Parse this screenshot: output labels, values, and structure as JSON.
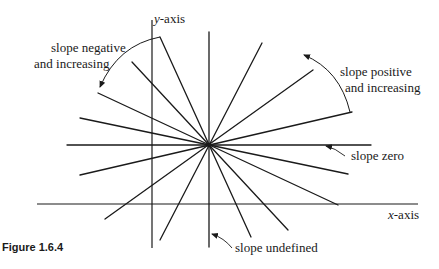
{
  "figure": {
    "caption": "Figure 1.6.4"
  },
  "axes": {
    "y_axis_var": "y",
    "y_axis_suffix": "-axis",
    "x_axis_var": "x",
    "x_axis_suffix": "-axis"
  },
  "annotations": {
    "slope_negative_line1": "slope negative",
    "slope_negative_line2": "and increasing",
    "slope_positive_line1": "slope positive",
    "slope_positive_line2": "and increasing",
    "slope_zero": "slope zero",
    "slope_undefined": "slope undefined"
  },
  "colors": {
    "line": "#1a1a1a",
    "background": "#ffffff"
  },
  "geometry": {
    "center": [
      209,
      145
    ],
    "y_axis": {
      "x": 152,
      "y1": 20,
      "y2": 248
    },
    "x_axis": {
      "y": 204,
      "x1": 37,
      "x2": 418
    },
    "lines": [
      {
        "name": "vertical",
        "x1": 209,
        "y1": 32,
        "x2": 209,
        "y2": 247
      },
      {
        "name": "horizontal",
        "x1": 67,
        "y1": 145,
        "x2": 371,
        "y2": 145
      },
      {
        "name": "neg-steep",
        "x1": 160,
        "y1": 37,
        "x2": 251,
        "y2": 237
      },
      {
        "name": "neg-mid",
        "x1": 132,
        "y1": 62,
        "x2": 288,
        "y2": 230
      },
      {
        "name": "neg-shallow",
        "x1": 98,
        "y1": 93,
        "x2": 338,
        "y2": 205
      },
      {
        "name": "neg-flat",
        "x1": 80,
        "y1": 118,
        "x2": 348,
        "y2": 174
      },
      {
        "name": "pos-steep",
        "x1": 262,
        "y1": 43,
        "x2": 160,
        "y2": 240
      },
      {
        "name": "pos-mid",
        "x1": 313,
        "y1": 70,
        "x2": 105,
        "y2": 219
      },
      {
        "name": "pos-flat",
        "x1": 352,
        "y1": 112,
        "x2": 80,
        "y2": 175
      }
    ]
  }
}
